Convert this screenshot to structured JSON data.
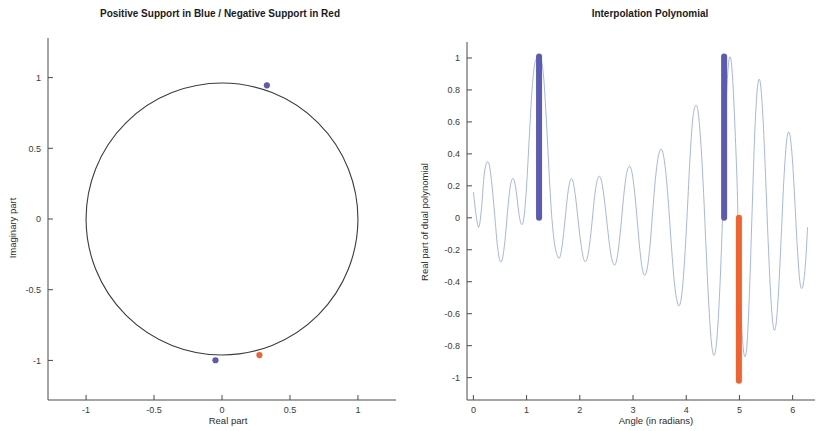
{
  "figure": {
    "width": 822,
    "height": 431,
    "background": "#ffffff"
  },
  "colors": {
    "positive_support_blue": "#5b5bb5",
    "negative_support_red": "#f4612c",
    "curve_blue": "#8fa3d8",
    "axis": "#4a4a4a",
    "circle": "#3c3c3c",
    "text": "#2b2b2b"
  },
  "panels": [
    {
      "id": "unit-circle-panel",
      "title": "Positive Support in Blue / Negative Support in Red",
      "xlabel": "Real part",
      "ylabel": "Imaginary part"
    },
    {
      "id": "interpolation-panel",
      "title": "Interpolation Polynomial",
      "xlabel": "Angle (in radians)",
      "ylabel": "Real part of dual polynomial"
    }
  ],
  "chart_data": [
    {
      "type": "scatter",
      "id": "unit-circle",
      "title": "Positive Support in Blue / Negative Support in Red",
      "xlabel": "Real part",
      "ylabel": "Imaginary part",
      "xlim": [
        -1.28,
        1.28
      ],
      "ylim": [
        -1.28,
        1.28
      ],
      "xticks": [
        -1,
        -0.5,
        0,
        0.5,
        1
      ],
      "xticklabels": [
        "-1",
        "-0.5",
        "0",
        "0.5",
        "1"
      ],
      "yticks": [
        -1,
        -0.5,
        0,
        0.5,
        1
      ],
      "yticklabels": [
        "-1",
        "-0.5",
        "0",
        "0.5",
        "1"
      ],
      "grid": false,
      "legend": "none",
      "reference_curve": {
        "name": "unit circle",
        "radius": 1,
        "center": [
          0,
          0
        ],
        "color": "#3c3c3c"
      },
      "series": [
        {
          "name": "Positive support",
          "color": "#5b5bb5",
          "marker": "filled-circle",
          "points": [
            {
              "x": 0.33,
              "y": 0.945,
              "angle_rad": 1.234
            },
            {
              "x": -0.048,
              "y": -0.999,
              "angle_rad": 4.712
            }
          ]
        },
        {
          "name": "Negative support",
          "color": "#f4612c",
          "marker": "filled-circle",
          "points": [
            {
              "x": 0.275,
              "y": -0.962,
              "angle_rad": 4.99
            }
          ]
        }
      ]
    },
    {
      "type": "line",
      "id": "interpolation-polynomial",
      "title": "Interpolation Polynomial",
      "xlabel": "Angle (in radians)",
      "ylabel": "Real part of dual polynomial",
      "xlim": [
        -0.12,
        6.42
      ],
      "ylim": [
        -1.14,
        1.1
      ],
      "xticks": [
        0,
        1,
        2,
        3,
        4,
        5,
        6
      ],
      "xticklabels": [
        "0",
        "1",
        "2",
        "3",
        "4",
        "5",
        "6"
      ],
      "yticks": [
        -1,
        -0.8,
        -0.6,
        -0.4,
        -0.2,
        0,
        0.2,
        0.4,
        0.6,
        0.8,
        1
      ],
      "yticklabels": [
        "-1",
        "-0.8",
        "-0.6",
        "-0.4",
        "-0.2",
        "0",
        "0.2",
        "0.4",
        "0.6",
        "0.8",
        "1"
      ],
      "grid": false,
      "legend": "none",
      "series": [
        {
          "name": "Real part of dual polynomial",
          "color": "#8fa3d8",
          "x": [
            0.0,
            0.05,
            0.1,
            0.15,
            0.2,
            0.25,
            0.3,
            0.35,
            0.4,
            0.45,
            0.5,
            0.55,
            0.6,
            0.65,
            0.7,
            0.75,
            0.8,
            0.85,
            0.9,
            0.95,
            1.0,
            1.05,
            1.1,
            1.15,
            1.2,
            1.234,
            1.27,
            1.32,
            1.37,
            1.42,
            1.47,
            1.52,
            1.57,
            1.62,
            1.67,
            1.72,
            1.77,
            1.82,
            1.87,
            1.92,
            1.97,
            2.02,
            2.07,
            2.12,
            2.17,
            2.22,
            2.27,
            2.32,
            2.37,
            2.42,
            2.47,
            2.52,
            2.57,
            2.62,
            2.67,
            2.72,
            2.77,
            2.82,
            2.87,
            2.92,
            2.97,
            3.02,
            3.07,
            3.12,
            3.17,
            3.22,
            3.27,
            3.32,
            3.37,
            3.42,
            3.47,
            3.52,
            3.57,
            3.62,
            3.67,
            3.72,
            3.77,
            3.82,
            3.87,
            3.92,
            3.97,
            4.02,
            4.07,
            4.12,
            4.17,
            4.22,
            4.27,
            4.32,
            4.37,
            4.42,
            4.47,
            4.52,
            4.57,
            4.62,
            4.67,
            4.712,
            4.76,
            4.81,
            4.86,
            4.91,
            4.96,
            4.99,
            5.04,
            5.09,
            5.14,
            5.19,
            5.24,
            5.29,
            5.34,
            5.39,
            5.44,
            5.49,
            5.54,
            5.59,
            5.64,
            5.69,
            5.74,
            5.79,
            5.84,
            5.89,
            5.94,
            5.99,
            6.04,
            6.09,
            6.14,
            6.19,
            6.24,
            6.28
          ],
          "y": [
            0.16,
            0.02,
            -0.06,
            0.05,
            0.26,
            0.345,
            0.33,
            0.2,
            0.02,
            -0.17,
            -0.27,
            -0.25,
            -0.12,
            0.07,
            0.21,
            0.245,
            0.18,
            0.04,
            -0.04,
            0.0,
            0.2,
            0.5,
            0.79,
            0.96,
            1.0,
            1.01,
            1.0,
            0.88,
            0.62,
            0.3,
            0.02,
            -0.15,
            -0.23,
            -0.25,
            -0.17,
            -0.02,
            0.14,
            0.235,
            0.23,
            0.13,
            -0.02,
            -0.16,
            -0.255,
            -0.27,
            -0.2,
            -0.06,
            0.11,
            0.225,
            0.26,
            0.21,
            0.09,
            -0.06,
            -0.2,
            -0.28,
            -0.29,
            -0.21,
            -0.06,
            0.12,
            0.26,
            0.32,
            0.3,
            0.19,
            0.02,
            -0.17,
            -0.31,
            -0.36,
            -0.31,
            -0.17,
            0.04,
            0.24,
            0.375,
            0.43,
            0.395,
            0.27,
            0.07,
            -0.17,
            -0.38,
            -0.51,
            -0.55,
            -0.47,
            -0.26,
            0.04,
            0.37,
            0.61,
            0.7,
            0.67,
            0.49,
            0.2,
            -0.17,
            -0.52,
            -0.77,
            -0.86,
            -0.78,
            -0.52,
            -0.12,
            0.35,
            0.79,
            1.0,
            0.93,
            0.61,
            0.17,
            -0.29,
            -0.67,
            -0.86,
            -0.8,
            -0.45,
            0.06,
            0.55,
            0.82,
            0.85,
            0.64,
            0.27,
            -0.15,
            -0.5,
            -0.69,
            -0.66,
            -0.43,
            -0.08,
            0.27,
            0.49,
            0.53,
            0.39,
            0.11,
            -0.2,
            -0.41,
            -0.43,
            -0.29,
            -0.06
          ]
        }
      ],
      "support_markers": [
        {
          "name": "Positive support",
          "type": "vertical-bar",
          "color": "#5b5bb5",
          "x": 1.234,
          "y_bottom": 0.0,
          "y_top": 1.01
        },
        {
          "name": "Positive support",
          "type": "vertical-bar",
          "color": "#5b5bb5",
          "x": 4.712,
          "y_bottom": 0.0,
          "y_top": 1.01
        },
        {
          "name": "Negative support",
          "type": "vertical-bar",
          "color": "#f4612c",
          "x": 4.99,
          "y_bottom": -1.02,
          "y_top": 0.0
        }
      ]
    }
  ]
}
